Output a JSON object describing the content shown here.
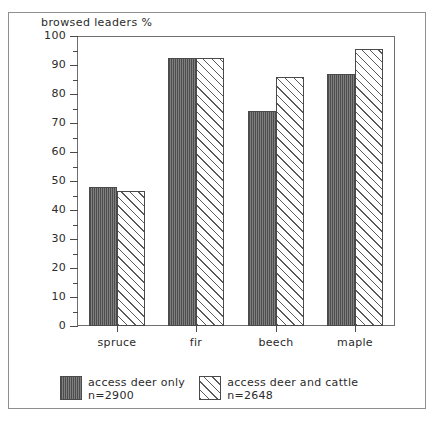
{
  "chart_data": {
    "type": "bar",
    "title": "browsed leaders %",
    "xlabel": "",
    "ylabel": "browsed leaders %",
    "ylim": [
      0,
      100
    ],
    "ytick_step": 10,
    "yminor_step": 5,
    "grid": false,
    "legend_position": "bottom",
    "categories": [
      "spruce",
      "fir",
      "beech",
      "maple"
    ],
    "ytick_labels": [
      "0",
      "10",
      "20",
      "30",
      "40",
      "50",
      "60",
      "70",
      "80",
      "90",
      "100"
    ],
    "series": [
      {
        "name": "access deer only",
        "sample_label": "n=2900",
        "pattern": "vertical-stripe-dark",
        "color": "#6e6e6e",
        "values": [
          48,
          92.5,
          74,
          87
        ]
      },
      {
        "name": "access deer and cattle",
        "sample_label": "n=2648",
        "pattern": "diagonal-hatch",
        "color": "#ffffff",
        "values": [
          46.5,
          92.5,
          86,
          95.5
        ]
      }
    ]
  },
  "legend": {
    "entries": [
      {
        "label": "access deer only",
        "sublabel": "n=2900"
      },
      {
        "label": "access deer and cattle",
        "sublabel": "n=2648"
      }
    ]
  }
}
